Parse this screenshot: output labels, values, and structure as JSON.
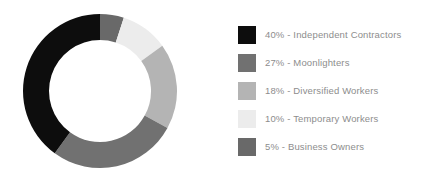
{
  "chart_data": {
    "type": "pie",
    "variant": "donut",
    "title": "",
    "subtitle": "",
    "xlabel": "",
    "ylabel": "",
    "grid": false,
    "legend_position": "right",
    "start_angle_deg": 0,
    "direction": "clockwise",
    "value_unit": "%",
    "total": 100,
    "categories": [
      "Independent Contractors",
      "Moonlighters",
      "Diversified Workers",
      "Temporary Workers",
      "Business Owners"
    ],
    "values": [
      40,
      27,
      18,
      10,
      5
    ],
    "colors": [
      "#0d0d0d",
      "#717171",
      "#b4b4b4",
      "#ececec",
      "#696969"
    ],
    "slices": [
      {
        "label": "Independent Contractors",
        "value": 40,
        "display": "40%",
        "color": "#0d0d0d"
      },
      {
        "label": "Moonlighters",
        "value": 27,
        "display": "27%",
        "color": "#717171"
      },
      {
        "label": "Diversified Workers",
        "value": 18,
        "display": "18%",
        "color": "#b4b4b4"
      },
      {
        "label": "Temporary Workers",
        "value": 10,
        "display": "10%",
        "color": "#ececec"
      },
      {
        "label": "Business Owners",
        "value": 5,
        "display": "5%",
        "color": "#696969"
      }
    ],
    "draw_order_clockwise_from_top": [
      "Business Owners",
      "Temporary Workers",
      "Diversified Workers",
      "Moonlighters",
      "Independent Contractors"
    ]
  },
  "legend": {
    "items": [
      {
        "swatch": "#0d0d0d",
        "text": "40% - Independent Contractors"
      },
      {
        "swatch": "#717171",
        "text": "27% - Moonlighters"
      },
      {
        "swatch": "#b4b4b4",
        "text": "18% - Diversified Workers"
      },
      {
        "swatch": "#ececec",
        "text": "10% - Temporary Workers"
      },
      {
        "swatch": "#696969",
        "text": "5% - Business Owners"
      }
    ]
  },
  "style": {
    "background": "#ffffff",
    "legend_text_color": "#8d8d8d",
    "donut_center": [
      77,
      77
    ],
    "donut_outer_radius": 77,
    "donut_inner_radius": 51
  }
}
